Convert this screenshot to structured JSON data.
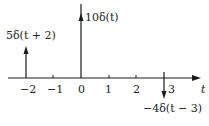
{
  "diagram": {
    "axis_label": "t",
    "ticks": [
      {
        "value": -2,
        "label": "−2",
        "x": 26
      },
      {
        "value": -1,
        "label": "−1",
        "x": 53
      },
      {
        "value": 0,
        "label": "0",
        "x": 81
      },
      {
        "value": 1,
        "label": "1",
        "x": 109
      },
      {
        "value": 2,
        "label": "2",
        "x": 136
      },
      {
        "value": 3,
        "label": "3",
        "x": 164
      }
    ],
    "impulses": [
      {
        "position": -2,
        "weight": 5,
        "label": "5δ(t + 2)"
      },
      {
        "position": 0,
        "weight": 10,
        "label": "10δ(t)"
      },
      {
        "position": 3,
        "weight": -4,
        "label": "−4δ(t − 3)"
      }
    ],
    "colors": {
      "stroke": "#1a1a1a",
      "background": "#ffffff"
    }
  }
}
